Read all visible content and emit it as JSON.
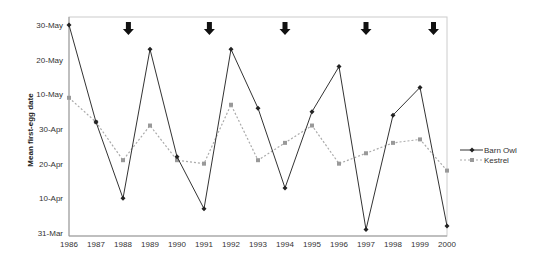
{
  "chart_data": {
    "type": "line",
    "title": "",
    "xlabel": "",
    "ylabel": "Mean first-egg date",
    "x": [
      1986,
      1987,
      1988,
      1989,
      1990,
      1991,
      1992,
      1993,
      1994,
      1995,
      1996,
      1997,
      1998,
      1999,
      2000
    ],
    "y_ticks": [
      "31-Mar",
      "10-Apr",
      "20-Apr",
      "30-Apr",
      "10-May",
      "20-May",
      "30-May"
    ],
    "y_tick_days": [
      0,
      10,
      20,
      30,
      40,
      50,
      60
    ],
    "ylim_days_after_31_Mar": [
      0,
      60
    ],
    "xlim": [
      1986,
      2000
    ],
    "grid": false,
    "legend_position": "right",
    "series": [
      {
        "name": "Barn Owl",
        "style": "solid",
        "marker": "diamond",
        "color": "#333333",
        "values_days_after_31_Mar": [
          60,
          32,
          10,
          53,
          22,
          7,
          53,
          36,
          13,
          35,
          48,
          1,
          34,
          42,
          2
        ],
        "values_dates": [
          "30-May",
          "2-May",
          "10-Apr",
          "23-May",
          "22-Apr",
          "7-Apr",
          "23-May",
          "6-May",
          "13-Apr",
          "5-May",
          "18-May",
          "1-Apr",
          "4-May",
          "12-May",
          "2-Apr"
        ]
      },
      {
        "name": "Kestrel",
        "style": "dotted",
        "marker": "square",
        "color": "#999999",
        "values_days_after_31_Mar": [
          39,
          32,
          21,
          31,
          21,
          20,
          37,
          21,
          26,
          31,
          20,
          23,
          26,
          27,
          18
        ],
        "values_dates": [
          "9-May",
          "2-May",
          "21-Apr",
          "1-May",
          "21-Apr",
          "20-Apr",
          "7-May",
          "21-Apr",
          "26-Apr",
          "1-May",
          "20-Apr",
          "23-Apr",
          "26-Apr",
          "27-Apr",
          "18-Apr"
        ]
      }
    ],
    "annotations": [
      {
        "type": "down-arrow",
        "x": 1988.2
      },
      {
        "type": "down-arrow",
        "x": 1991.2
      },
      {
        "type": "down-arrow",
        "x": 1994.0
      },
      {
        "type": "down-arrow",
        "x": 1997.0
      },
      {
        "type": "down-arrow",
        "x": 1999.5
      }
    ]
  },
  "legend": {
    "items": [
      {
        "label": "Barn Owl"
      },
      {
        "label": "Kestrel"
      }
    ]
  }
}
